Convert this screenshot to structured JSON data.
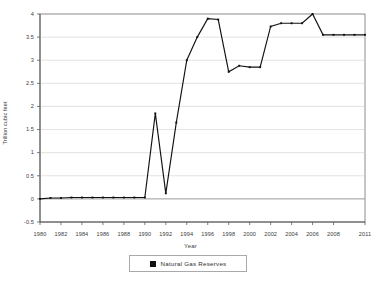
{
  "chart_data": {
    "type": "line",
    "title": "",
    "xlabel": "Year",
    "ylabel": "Trillion cubic feet",
    "xlim": [
      1980,
      2011
    ],
    "ylim": [
      -0.5,
      4
    ],
    "ytick_labels": [
      "4",
      "3.5",
      "3",
      "2.5",
      "2",
      "1.5",
      "1",
      "0.5",
      "0",
      "-0.5"
    ],
    "ytick_values": [
      4,
      3.5,
      3,
      2.5,
      2,
      1.5,
      1,
      0.5,
      0,
      -0.5
    ],
    "xtick_labels": [
      "1980",
      "1982",
      "1984",
      "1986",
      "1988",
      "1990",
      "1992",
      "1994",
      "1996",
      "1998",
      "2000",
      "2002",
      "2004",
      "2006",
      "2008",
      "2011"
    ],
    "xtick_values": [
      1980,
      1982,
      1984,
      1986,
      1988,
      1990,
      1992,
      1994,
      1996,
      1998,
      2000,
      2002,
      2004,
      2006,
      2008,
      2011
    ],
    "grid": true,
    "grid_axis": "y",
    "legend": [
      "Natural Gas Reserves"
    ],
    "legend_position": "bottom",
    "series": [
      {
        "name": "Natural Gas Reserves",
        "color": "#111111",
        "marker": "square",
        "x": [
          1980,
          1981,
          1982,
          1983,
          1984,
          1985,
          1986,
          1987,
          1988,
          1989,
          1990,
          1991,
          1992,
          1993,
          1994,
          1995,
          1996,
          1997,
          1998,
          1999,
          2000,
          2001,
          2002,
          2003,
          2004,
          2005,
          2006,
          2007,
          2008,
          2009,
          2010,
          2011
        ],
        "values": [
          0.0,
          0.02,
          0.02,
          0.03,
          0.03,
          0.03,
          0.03,
          0.03,
          0.03,
          0.03,
          0.03,
          1.85,
          0.12,
          1.65,
          3.0,
          3.5,
          3.9,
          3.88,
          2.75,
          2.88,
          2.85,
          2.85,
          3.73,
          3.8,
          3.8,
          3.8,
          4.0,
          3.55,
          3.55,
          3.55,
          3.55,
          3.55
        ]
      }
    ]
  },
  "legend": {
    "entries": [
      {
        "label": "Natural Gas Reserves",
        "color": "#111111"
      }
    ]
  }
}
